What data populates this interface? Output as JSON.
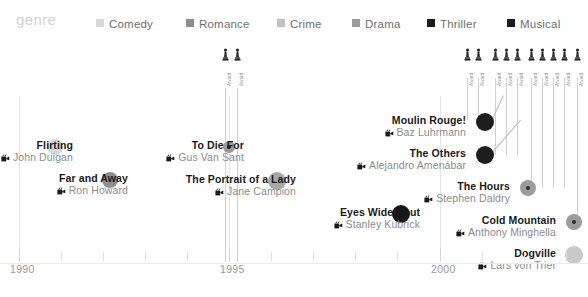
{
  "legend": {
    "title": "genre",
    "items": [
      {
        "label": "Comedy",
        "color": "#d8d8d8",
        "x": 96
      },
      {
        "label": "Romance",
        "color": "#8d8d8d",
        "x": 186
      },
      {
        "label": "Crime",
        "color": "#c2c2c2",
        "x": 277
      },
      {
        "label": "Drama",
        "color": "#9c9c9c",
        "x": 352
      },
      {
        "label": "Thriller",
        "color": "#1a1a1a",
        "x": 427
      },
      {
        "label": "Musical",
        "color": "#1a1a1a",
        "x": 507
      }
    ]
  },
  "axis": {
    "labels": [
      {
        "text": "1990",
        "x": 10,
        "tick": 19
      },
      {
        "text": "1995",
        "x": 220,
        "tick": 229
      },
      {
        "text": "2000",
        "x": 431,
        "tick": 440
      }
    ],
    "minor_ticks": [
      19,
      61,
      103,
      145,
      187,
      229,
      271,
      313,
      355,
      397,
      440,
      482,
      524,
      566
    ]
  },
  "awards": {
    "label": "Award",
    "markers": [
      {
        "x": 222,
        "stem_top": 88,
        "stem_bottom": 262,
        "icon": "oscar-statuette-icon"
      },
      {
        "x": 234,
        "stem_top": 88,
        "stem_bottom": 262,
        "icon": "oscar-statuette-icon"
      },
      {
        "x": 464,
        "stem_top": 78,
        "stem_bottom": 120,
        "icon": "oscar-statuette-icon"
      },
      {
        "x": 475,
        "stem_top": 78,
        "stem_bottom": 120,
        "icon": "oscar-statuette-icon"
      },
      {
        "x": 492,
        "stem_top": 78,
        "stem_bottom": 155,
        "icon": "oscar-statuette-icon"
      },
      {
        "x": 503,
        "stem_top": 78,
        "stem_bottom": 155,
        "icon": "oscar-statuette-icon"
      },
      {
        "x": 514,
        "stem_top": 78,
        "stem_bottom": 155,
        "icon": "oscar-statuette-icon"
      },
      {
        "x": 528,
        "stem_top": 78,
        "stem_bottom": 188,
        "icon": "oscar-statuette-icon"
      },
      {
        "x": 539,
        "stem_top": 78,
        "stem_bottom": 188,
        "icon": "oscar-statuette-icon"
      },
      {
        "x": 550,
        "stem_top": 78,
        "stem_bottom": 188,
        "icon": "oscar-statuette-icon"
      },
      {
        "x": 561,
        "stem_top": 78,
        "stem_bottom": 188,
        "icon": "oscar-statuette-icon"
      },
      {
        "x": 574,
        "stem_top": 78,
        "stem_bottom": 222,
        "icon": "oscar-statuette-icon"
      }
    ]
  },
  "gridlines": [
    {
      "x": 19,
      "top": 96,
      "height": 166
    },
    {
      "x": 229,
      "top": 96,
      "height": 166
    },
    {
      "x": 440,
      "top": 96,
      "height": 166
    }
  ],
  "films": [
    {
      "title": "Flirting",
      "director": "John Duigan",
      "genre": "Comedy",
      "color": "#d8d8d8",
      "cx": 55,
      "cy": 147,
      "r": 8,
      "label_right": 73,
      "label_top": 139,
      "core": false
    },
    {
      "title": "Far and Away",
      "director": "Ron Howard",
      "genre": "Drama",
      "color": "#8f8f8f",
      "cx": 110,
      "cy": 180,
      "r": 8,
      "label_right": 128,
      "label_top": 172,
      "core": false
    },
    {
      "title": "To Die For",
      "director": "Gus Van Sant",
      "genre": "Crime",
      "color": "#9a9a9a",
      "cx": 229,
      "cy": 147,
      "r": 6,
      "label_right": 244,
      "label_top": 139,
      "core": true,
      "core_r": 2
    },
    {
      "title": "The Portrait of a Lady",
      "director": "Jane Campion",
      "genre": "Drama",
      "color": "#a8a8a8",
      "cx": 277,
      "cy": 181,
      "r": 9,
      "label_right": 296,
      "label_top": 173,
      "core": false
    },
    {
      "title": "Eyes Wide Shut",
      "director": "Stanley Kubrick",
      "genre": "Thriller",
      "color": "#181818",
      "cx": 401,
      "cy": 214,
      "r": 9,
      "label_right": 420,
      "label_top": 206,
      "core": false
    },
    {
      "title": "Moulin Rouge!",
      "director": "Baz Luhrmann",
      "genre": "Musical",
      "color": "#1d1d1d",
      "cx": 485,
      "cy": 122,
      "r": 9,
      "label_right": 466,
      "label_top": 114,
      "core": false
    },
    {
      "title": "The Others",
      "director": "Alejandro Amenábar",
      "genre": "Thriller",
      "color": "#1d1d1d",
      "cx": 485,
      "cy": 155,
      "r": 9,
      "label_right": 466,
      "label_top": 147,
      "core": false
    },
    {
      "title": "The Hours",
      "director": "Stephen Daldry",
      "cx": 528,
      "cy": 188,
      "r": 8,
      "genre": "Drama",
      "color": "#9c9c9c",
      "label_right": 510,
      "label_top": 180,
      "core": true,
      "core_r": 2
    },
    {
      "title": "Cold Mountain",
      "director": "Anthony Minghella",
      "genre": "Drama",
      "color": "#9c9c9c",
      "cx": 574,
      "cy": 222,
      "r": 8,
      "label_right": 556,
      "label_top": 214,
      "core": true,
      "core_r": 2
    },
    {
      "title": "Dogville",
      "director": "Lars von Trier",
      "genre": "Comedy",
      "color": "#c9c9c9",
      "cx": 574,
      "cy": 255,
      "r": 9,
      "label_right": 556,
      "label_top": 247,
      "core": false
    }
  ],
  "leaders": [
    {
      "x1": 492,
      "y1": 119,
      "x2": 503,
      "y2": 95
    },
    {
      "x1": 492,
      "y1": 152,
      "x2": 520,
      "y2": 120
    }
  ]
}
